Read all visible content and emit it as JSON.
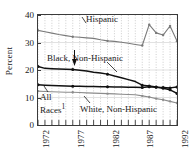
{
  "chart_data": {
    "type": "line",
    "title": "",
    "xlabel": "",
    "ylabel": "Percent",
    "xlim": [
      1972,
      1992
    ],
    "ylim": [
      0,
      40
    ],
    "yticks": [
      0,
      10,
      20,
      30,
      40
    ],
    "xticks_labeled": [
      1972,
      1977,
      1982,
      1987,
      1992
    ],
    "x": [
      1972,
      1973,
      1974,
      1975,
      1976,
      1977,
      1978,
      1979,
      1980,
      1981,
      1982,
      1983,
      1984,
      1985,
      1986,
      1987,
      1988,
      1989,
      1990,
      1991,
      1992
    ],
    "grid": "dotted-vertical",
    "legend": "inline-annotations",
    "series": [
      {
        "name": "Hispanic",
        "color": "#7a7a7a",
        "marker": "dot",
        "values": [
          34.4,
          33.9,
          33.4,
          32.9,
          32.5,
          32.1,
          31.9,
          31.7,
          31.5,
          31.0,
          30.6,
          30.4,
          30.1,
          29.7,
          29.3,
          28.9,
          36.5,
          33.5,
          32.7,
          36.0,
          30.5
        ]
      },
      {
        "name": "Black, Non-Hispanic",
        "color": "#111111",
        "marker": "dot",
        "values": [
          21.3,
          20.6,
          20.5,
          20.4,
          20.3,
          20.2,
          19.9,
          19.6,
          19.2,
          18.9,
          18.5,
          17.8,
          17.2,
          16.5,
          15.8,
          14.5,
          14.2,
          13.8,
          13.4,
          12.8,
          11.5
        ]
      },
      {
        "name": "All Races",
        "color": "#111111",
        "marker": "dot",
        "values": [
          14.6,
          14.5,
          14.4,
          14.3,
          14.2,
          14.1,
          14.1,
          14.0,
          14.0,
          13.9,
          13.9,
          13.8,
          13.8,
          13.7,
          13.7,
          13.6,
          13.9,
          13.7,
          13.6,
          13.5,
          13.8
        ]
      },
      {
        "name": "White, Non-Hispanic",
        "color": "#8c8c8c",
        "marker": "dot",
        "values": [
          12.3,
          12.2,
          12.1,
          12.0,
          11.9,
          11.9,
          11.8,
          11.7,
          11.6,
          11.5,
          11.4,
          11.3,
          11.2,
          11.1,
          11.0,
          10.6,
          10.2,
          9.6,
          9.2,
          8.6,
          8.0
        ]
      }
    ],
    "annotations": [
      {
        "name": "hispanic",
        "text": "Hispanic"
      },
      {
        "name": "black-non-hispanic",
        "text": "Black, Non-Hispanic"
      },
      {
        "name": "all-races",
        "text_line1": "All",
        "text_line2": "Races",
        "footnote_marker": "1"
      },
      {
        "name": "white-non-hispanic",
        "text": "White, Non-Hispanic"
      }
    ]
  },
  "axes": {
    "y": {
      "title": "Percent",
      "ticks": [
        {
          "value": 40,
          "label": "40"
        },
        {
          "value": 30,
          "label": "30"
        },
        {
          "value": 20,
          "label": "20"
        },
        {
          "value": 10,
          "label": "10"
        },
        {
          "value": 0,
          "label": "0"
        }
      ]
    },
    "x": {
      "ticks": [
        {
          "value": 1972,
          "label": "1972"
        },
        {
          "value": 1977,
          "label": "1977"
        },
        {
          "value": 1982,
          "label": "1982"
        },
        {
          "value": 1987,
          "label": "1987"
        },
        {
          "value": 1992,
          "label": "1992"
        }
      ]
    }
  }
}
